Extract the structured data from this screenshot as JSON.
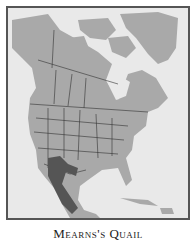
{
  "map": {
    "subject": "range map",
    "region": "North America",
    "colors": {
      "water": "#e9e9e9",
      "land": "#a9a9a9",
      "range": "#555555",
      "borders": "#333333",
      "frame": "#555555"
    }
  },
  "caption": {
    "title": "Mearns's Quail"
  }
}
